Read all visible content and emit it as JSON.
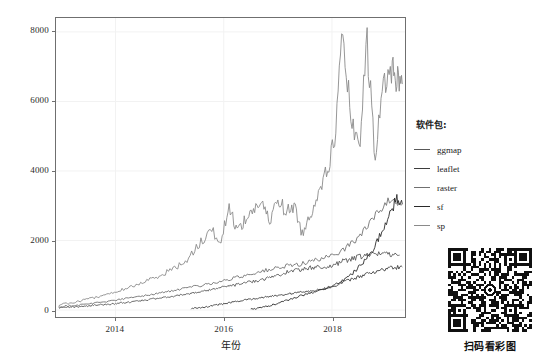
{
  "chart_data": {
    "type": "line",
    "title": "",
    "xlabel": "年份",
    "ylabel": "下载量",
    "xlim": [
      2012.9,
      2019.35
    ],
    "ylim": [
      -200,
      8400
    ],
    "xticks": [
      2014,
      2016,
      2018
    ],
    "xticklabels": [
      "2014",
      "2016",
      "2018"
    ],
    "yticks": [
      0,
      2000,
      4000,
      6000,
      8000
    ],
    "yticklabels": [
      "0",
      "2000",
      "4000",
      "6000",
      "8000"
    ],
    "grid": true,
    "grid_color": "#f2f2f2",
    "legend_position": "right",
    "legend_title": "软件包:",
    "series": [
      {
        "name": "ggmap",
        "color": "#585858",
        "x": [
          2012.95,
          2013.1,
          2013.25,
          2013.4,
          2013.55,
          2013.7,
          2013.85,
          2014.0,
          2014.15,
          2014.3,
          2014.45,
          2014.6,
          2014.75,
          2014.9,
          2015.05,
          2015.2,
          2015.35,
          2015.5,
          2015.65,
          2015.8,
          2015.95,
          2016.1,
          2016.25,
          2016.4,
          2016.55,
          2016.7,
          2016.85,
          2017.0,
          2017.15,
          2017.3,
          2017.45,
          2017.6,
          2017.75,
          2017.9,
          2018.05,
          2018.2,
          2018.35,
          2018.5,
          2018.65,
          2018.8,
          2018.95,
          2019.1,
          2019.25
        ],
        "values": [
          60,
          75,
          95,
          110,
          130,
          150,
          165,
          185,
          210,
          240,
          265,
          300,
          330,
          360,
          395,
          430,
          470,
          510,
          560,
          600,
          650,
          690,
          730,
          780,
          830,
          880,
          930,
          1010,
          1080,
          1140,
          1180,
          1210,
          1230,
          1250,
          1290,
          1400,
          1480,
          1520,
          1560,
          1600,
          1640,
          1620,
          1580
        ]
      },
      {
        "name": "leaflet",
        "color": "#3d3d3d",
        "x": [
          2015.4,
          2015.55,
          2015.7,
          2015.85,
          2016.0,
          2016.15,
          2016.3,
          2016.45,
          2016.6,
          2016.75,
          2016.9,
          2017.05,
          2017.2,
          2017.35,
          2017.5,
          2017.65,
          2017.8,
          2017.95,
          2018.1,
          2018.25,
          2018.4,
          2018.55,
          2018.7,
          2018.85,
          2019.0,
          2019.15,
          2019.3
        ],
        "values": [
          40,
          70,
          100,
          140,
          180,
          220,
          260,
          300,
          340,
          370,
          400,
          430,
          470,
          500,
          530,
          560,
          600,
          650,
          720,
          820,
          900,
          980,
          1060,
          1120,
          1180,
          1220,
          1240
        ]
      },
      {
        "name": "raster",
        "color": "#707070",
        "x": [
          2012.95,
          2013.15,
          2013.35,
          2013.55,
          2013.75,
          2013.95,
          2014.15,
          2014.35,
          2014.55,
          2014.75,
          2014.95,
          2015.15,
          2015.35,
          2015.55,
          2015.75,
          2015.95,
          2016.15,
          2016.35,
          2016.55,
          2016.75,
          2016.95,
          2017.15,
          2017.35,
          2017.55,
          2017.75,
          2017.95,
          2018.15,
          2018.35,
          2018.55,
          2018.75,
          2018.95,
          2019.15,
          2019.3
        ],
        "values": [
          90,
          120,
          150,
          190,
          230,
          270,
          320,
          370,
          420,
          470,
          530,
          580,
          640,
          700,
          760,
          820,
          900,
          980,
          1060,
          1130,
          1190,
          1250,
          1310,
          1380,
          1450,
          1520,
          1700,
          1900,
          2200,
          2600,
          3000,
          3200,
          3050
        ]
      },
      {
        "name": "sf",
        "color": "#2a2a2a",
        "x": [
          2016.5,
          2016.65,
          2016.8,
          2016.95,
          2017.1,
          2017.25,
          2017.4,
          2017.55,
          2017.7,
          2017.85,
          2018.0,
          2018.15,
          2018.3,
          2018.45,
          2018.6,
          2018.75,
          2018.9,
          2019.05,
          2019.2,
          2019.3
        ],
        "values": [
          20,
          60,
          110,
          170,
          240,
          320,
          400,
          470,
          540,
          600,
          680,
          800,
          950,
          1150,
          1400,
          1750,
          2200,
          2700,
          3200,
          3050
        ]
      },
      {
        "name": "sp",
        "color": "#8a8a8a",
        "x": [
          2012.95,
          2013.15,
          2013.35,
          2013.55,
          2013.75,
          2013.95,
          2014.15,
          2014.35,
          2014.55,
          2014.75,
          2014.95,
          2015.15,
          2015.35,
          2015.55,
          2015.75,
          2015.95,
          2016.1,
          2016.25,
          2016.4,
          2016.55,
          2016.7,
          2016.85,
          2017.0,
          2017.15,
          2017.3,
          2017.45,
          2017.6,
          2017.75,
          2017.9,
          2018.05,
          2018.2,
          2018.35,
          2018.5,
          2018.65,
          2018.8,
          2018.95,
          2019.1,
          2019.2,
          2019.3
        ],
        "values": [
          150,
          200,
          260,
          330,
          410,
          500,
          600,
          700,
          820,
          950,
          1100,
          1250,
          1500,
          1900,
          2300,
          2000,
          2950,
          2300,
          2600,
          2900,
          3100,
          2500,
          3250,
          2800,
          3000,
          2200,
          2700,
          3500,
          3900,
          5000,
          7900,
          5500,
          4500,
          7700,
          4300,
          6600,
          6900,
          6700,
          6500
        ]
      }
    ]
  },
  "axes": {
    "y_title": "下载量",
    "x_title": "年份"
  },
  "legend": {
    "title": "软件包:",
    "items": [
      {
        "label": "ggmap",
        "color": "#585858"
      },
      {
        "label": "leaflet",
        "color": "#3d3d3d"
      },
      {
        "label": "raster",
        "color": "#707070"
      },
      {
        "label": "sf",
        "color": "#2a2a2a"
      },
      {
        "label": "sp",
        "color": "#8a8a8a"
      }
    ]
  },
  "qr": {
    "caption": "扫码看彩图"
  }
}
